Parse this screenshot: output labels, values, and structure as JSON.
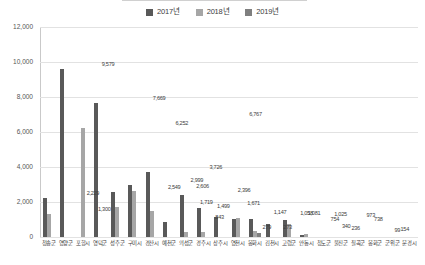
{
  "chart_data": {
    "type": "bar",
    "title": "",
    "xlabel": "",
    "ylabel": "",
    "ylim": [
      0,
      12000
    ],
    "ytick_labels": [
      "12,000",
      "10,000",
      "8,000",
      "6,000",
      "4,000",
      "2,000",
      "0"
    ],
    "ytick_values": [
      12000,
      10000,
      8000,
      6000,
      4000,
      2000,
      0
    ],
    "grid": true,
    "legend_position": "top-center",
    "categories": [
      "청송군",
      "영양군",
      "포항시",
      "영덕군",
      "성주군",
      "구미시",
      "경산시",
      "예천군",
      "의성군",
      "경주시",
      "상주시",
      "영천시",
      "봉화시",
      "김천시",
      "고령군",
      "안동시",
      "청도군",
      "울진군",
      "칠곡군",
      "봉화군",
      "군위군",
      "문경시"
    ],
    "series": [
      {
        "name": "2017년",
        "color": "#595959",
        "values": [
          2229,
          9579,
          0,
          7669,
          2549,
          2999,
          3726,
          843,
          2396,
          1671,
          1147,
          1058,
          1025,
          754,
          973,
          99,
          0,
          0,
          0,
          0,
          0,
          0
        ]
      },
      {
        "name": "2018년",
        "color": "#a6a6a6",
        "values": [
          1300,
          0,
          6252,
          0,
          1719,
          2606,
          1499,
          0,
          279,
          273,
          0,
          1081,
          340,
          0,
          738,
          154,
          0,
          0,
          0,
          0,
          0,
          0
        ]
      },
      {
        "name": "2019년",
        "color": "#7f7f7f",
        "values": [
          0,
          0,
          0,
          0,
          0,
          0,
          0,
          0,
          0,
          0,
          0,
          0,
          236,
          0,
          0,
          0,
          0,
          0,
          0,
          0,
          0,
          0
        ]
      }
    ],
    "data_labels": [
      {
        "text": "9,579",
        "value": 9579,
        "x_pct": 18.0
      },
      {
        "text": "7,669",
        "value": 7669,
        "x_pct": 31.5
      },
      {
        "text": "6,252",
        "value": 6252,
        "x_pct": 37.5
      },
      {
        "text": "6,767",
        "value": 6767,
        "x_pct": 57.0
      },
      {
        "text": "3,726",
        "value": 3726,
        "x_pct": 46.5
      },
      {
        "text": "2,999",
        "value": 2999,
        "x_pct": 41.5
      },
      {
        "text": "2,606",
        "value": 2606,
        "x_pct": 43.0
      },
      {
        "text": "2,549",
        "value": 2549,
        "x_pct": 35.5
      },
      {
        "text": "2,396",
        "value": 2396,
        "x_pct": 54.0
      },
      {
        "text": "2,229",
        "value": 2229,
        "x_pct": 14.0
      },
      {
        "text": "1,719",
        "value": 1719,
        "x_pct": 44.0
      },
      {
        "text": "1,671",
        "value": 1671,
        "x_pct": 56.5
      },
      {
        "text": "1,499",
        "value": 1499,
        "x_pct": 48.5
      },
      {
        "text": "1,300",
        "value": 1300,
        "x_pct": 17.0
      },
      {
        "text": "1,147",
        "value": 1147,
        "x_pct": 63.5
      },
      {
        "text": "1,058",
        "value": 1058,
        "x_pct": 70.5
      },
      {
        "text": "1,081",
        "value": 1081,
        "x_pct": 72.5
      },
      {
        "text": "1,025",
        "value": 1025,
        "x_pct": 79.5
      },
      {
        "text": "973",
        "value": 973,
        "x_pct": 87.5
      },
      {
        "text": "843",
        "value": 843,
        "x_pct": 47.5
      },
      {
        "text": "754",
        "value": 754,
        "x_pct": 78.0
      },
      {
        "text": "738",
        "value": 738,
        "x_pct": 89.5
      },
      {
        "text": "340",
        "value": 340,
        "x_pct": 81.0
      },
      {
        "text": "279",
        "value": 279,
        "x_pct": 60.0
      },
      {
        "text": "273",
        "value": 273,
        "x_pct": 65.5
      },
      {
        "text": "236",
        "value": 236,
        "x_pct": 83.5
      },
      {
        "text": "154",
        "value": 154,
        "x_pct": 96.5
      },
      {
        "text": "99",
        "value": 99,
        "x_pct": 94.5
      }
    ]
  },
  "legend": {
    "items": [
      {
        "label": "2017년",
        "color": "#595959"
      },
      {
        "label": "2018년",
        "color": "#a6a6a6"
      },
      {
        "label": "2019년",
        "color": "#7f7f7f"
      }
    ]
  }
}
